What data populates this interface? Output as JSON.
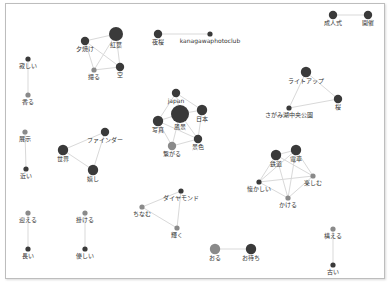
{
  "colors": {
    "dark": "#3a3a3a",
    "mid": "#8a8a8a",
    "edge": "#d9d9d9",
    "label": "#333333"
  },
  "nodes": [
    {
      "id": "yuyake",
      "label": "夕焼け",
      "size": 2,
      "tone": "dark"
    },
    {
      "id": "momiji",
      "label": "紅葉",
      "size": 4,
      "tone": "dark"
    },
    {
      "id": "toru",
      "label": "撮る",
      "size": 1,
      "tone": "mid"
    },
    {
      "id": "sora",
      "label": "空",
      "size": 2,
      "tone": "dark"
    },
    {
      "id": "yakei",
      "label": "夜桜",
      "size": 2,
      "tone": "dark"
    },
    {
      "id": "kanagawa",
      "label": "kanagawaphotoclub",
      "size": 1,
      "tone": "dark"
    },
    {
      "id": "seijinshiki",
      "label": "成人式",
      "size": 2,
      "tone": "dark"
    },
    {
      "id": "kaisai",
      "label": "開催",
      "size": 2,
      "tone": "dark"
    },
    {
      "id": "sabishii",
      "label": "寂しい",
      "size": 1,
      "tone": "dark"
    },
    {
      "id": "kaoru",
      "label": "香る",
      "size": 1,
      "tone": "mid"
    },
    {
      "id": "lightup",
      "label": "ライトアップ",
      "size": 3,
      "tone": "dark"
    },
    {
      "id": "sakura",
      "label": "桜",
      "size": 2,
      "tone": "dark"
    },
    {
      "id": "sagamiko",
      "label": "さがみ湖中央公園",
      "size": 1,
      "tone": "dark"
    },
    {
      "id": "japan",
      "label": "japan",
      "size": 2,
      "tone": "dark"
    },
    {
      "id": "fukei",
      "label": "風景",
      "size": 5,
      "tone": "dark"
    },
    {
      "id": "nihon",
      "label": "日本",
      "size": 3,
      "tone": "dark"
    },
    {
      "id": "shashin",
      "label": "写真",
      "size": 3,
      "tone": "dark"
    },
    {
      "id": "keshiki",
      "label": "景色",
      "size": 2,
      "tone": "dark"
    },
    {
      "id": "tsunagaru",
      "label": "繋がる",
      "size": 2,
      "tone": "mid"
    },
    {
      "id": "tenji",
      "label": "展示",
      "size": 1,
      "tone": "mid"
    },
    {
      "id": "chikai",
      "label": "近い",
      "size": 1,
      "tone": "dark"
    },
    {
      "id": "finder",
      "label": "ファインダー",
      "size": 2,
      "tone": "dark"
    },
    {
      "id": "sekai",
      "label": "世界",
      "size": 3,
      "tone": "dark"
    },
    {
      "id": "ureshii",
      "label": "嬉し",
      "size": 3,
      "tone": "dark"
    },
    {
      "id": "tetsudo",
      "label": "鉄道",
      "size": 3,
      "tone": "dark"
    },
    {
      "id": "densha",
      "label": "電車",
      "size": 3,
      "tone": "dark"
    },
    {
      "id": "natsukashii",
      "label": "懐かしい",
      "size": 1,
      "tone": "dark"
    },
    {
      "id": "tanoshimu",
      "label": "楽しむ",
      "size": 1,
      "tone": "mid"
    },
    {
      "id": "kakeru",
      "label": "かける",
      "size": 1,
      "tone": "mid"
    },
    {
      "id": "mukaeru",
      "label": "迎える",
      "size": 1,
      "tone": "mid"
    },
    {
      "id": "nagai",
      "label": "長い",
      "size": 1,
      "tone": "dark"
    },
    {
      "id": "kakeru2",
      "label": "掛ける",
      "size": 1,
      "tone": "mid"
    },
    {
      "id": "yasashii",
      "label": "優しい",
      "size": 1,
      "tone": "dark"
    },
    {
      "id": "daiya",
      "label": "ダイヤモンド",
      "size": 1,
      "tone": "dark"
    },
    {
      "id": "chinamu",
      "label": "ちなむ",
      "size": 1,
      "tone": "mid"
    },
    {
      "id": "kagayaku",
      "label": "輝く",
      "size": 1,
      "tone": "mid"
    },
    {
      "id": "oru",
      "label": "おる",
      "size": 3,
      "tone": "mid"
    },
    {
      "id": "omachi",
      "label": "お待ち",
      "size": 3,
      "tone": "dark"
    },
    {
      "id": "mukaeru2",
      "label": "構える",
      "size": 1,
      "tone": "mid"
    },
    {
      "id": "furui",
      "label": "古い",
      "size": 1,
      "tone": "dark"
    }
  ],
  "edges": [
    [
      "yuyake",
      "momiji"
    ],
    [
      "yuyake",
      "toru"
    ],
    [
      "yuyake",
      "sora"
    ],
    [
      "momiji",
      "toru"
    ],
    [
      "momiji",
      "sora"
    ],
    [
      "toru",
      "sora"
    ],
    [
      "yakei",
      "kanagawa"
    ],
    [
      "seijinshiki",
      "kaisai"
    ],
    [
      "sabishii",
      "kaoru"
    ],
    [
      "lightup",
      "sakura"
    ],
    [
      "lightup",
      "sagamiko"
    ],
    [
      "sakura",
      "sagamiko"
    ],
    [
      "japan",
      "fukei"
    ],
    [
      "japan",
      "nihon"
    ],
    [
      "japan",
      "shashin"
    ],
    [
      "fukei",
      "nihon"
    ],
    [
      "fukei",
      "shashin"
    ],
    [
      "fukei",
      "keshiki"
    ],
    [
      "fukei",
      "tsunagaru"
    ],
    [
      "nihon",
      "keshiki"
    ],
    [
      "shashin",
      "tsunagaru"
    ],
    [
      "keshiki",
      "tsunagaru"
    ],
    [
      "shashin",
      "keshiki"
    ],
    [
      "tenji",
      "chikai"
    ],
    [
      "finder",
      "sekai"
    ],
    [
      "finder",
      "ureshii"
    ],
    [
      "sekai",
      "ureshii"
    ],
    [
      "tetsudo",
      "densha"
    ],
    [
      "tetsudo",
      "natsukashii"
    ],
    [
      "tetsudo",
      "kakeru"
    ],
    [
      "tetsudo",
      "tanoshimu"
    ],
    [
      "densha",
      "natsukashii"
    ],
    [
      "densha",
      "kakeru"
    ],
    [
      "densha",
      "tanoshimu"
    ],
    [
      "natsukashii",
      "kakeru"
    ],
    [
      "tanoshimu",
      "kakeru"
    ],
    [
      "natsukashii",
      "tanoshimu"
    ],
    [
      "mukaeru",
      "nagai"
    ],
    [
      "kakeru2",
      "yasashii"
    ],
    [
      "daiya",
      "chinamu"
    ],
    [
      "daiya",
      "kagayaku"
    ],
    [
      "chinamu",
      "kagayaku"
    ],
    [
      "oru",
      "omachi"
    ],
    [
      "mukaeru2",
      "furui"
    ]
  ]
}
